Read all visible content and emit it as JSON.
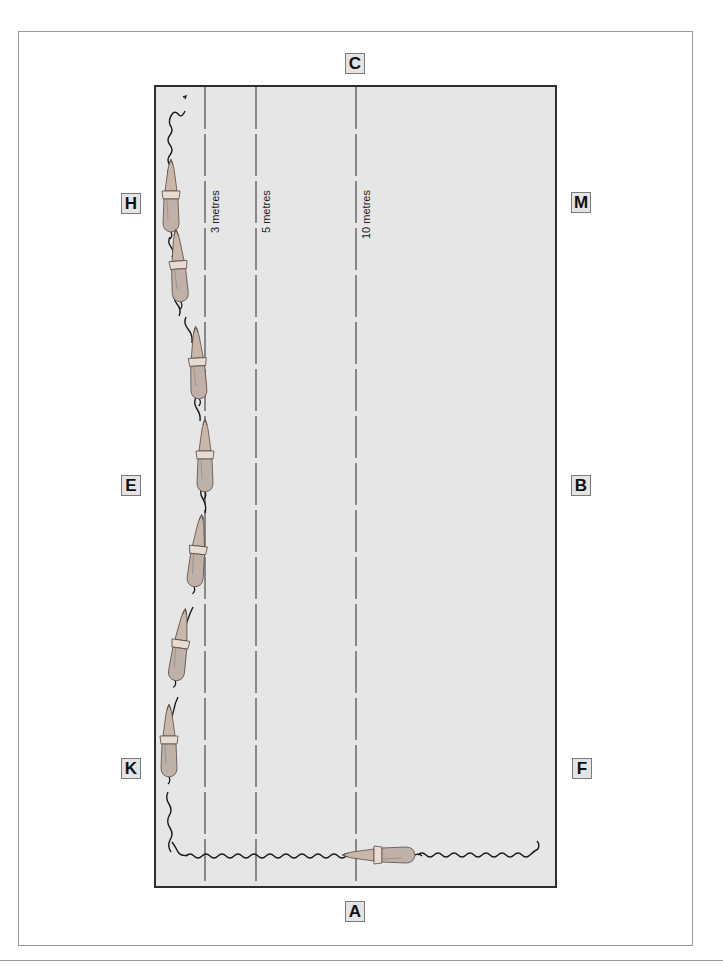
{
  "diagram": {
    "title": "",
    "arena": {
      "fill": "#e6e6e6",
      "border": "#2e2e2e",
      "markers": [
        {
          "id": "C",
          "label": "C",
          "side": "top"
        },
        {
          "id": "H",
          "label": "H",
          "side": "left"
        },
        {
          "id": "M",
          "label": "M",
          "side": "right"
        },
        {
          "id": "E",
          "label": "E",
          "side": "left"
        },
        {
          "id": "B",
          "label": "B",
          "side": "right"
        },
        {
          "id": "K",
          "label": "K",
          "side": "left"
        },
        {
          "id": "F",
          "label": "F",
          "side": "right"
        },
        {
          "id": "A",
          "label": "A",
          "side": "bottom"
        }
      ],
      "distance_lines": [
        {
          "label": "3 metres",
          "style": "dashed"
        },
        {
          "label": "5 metres",
          "style": "dashed"
        },
        {
          "label": "10 metres",
          "style": "dashed"
        }
      ]
    },
    "horses": {
      "count": 8,
      "description": "Horse and rider seen from above; track enters at A moving left, turns at K corner and proceeds up the long side in a shallow loop away from the track toward the 3-metre line and back to H, then exits toward C corner.",
      "path_marks": "wavy hoof-trail arrows"
    }
  }
}
